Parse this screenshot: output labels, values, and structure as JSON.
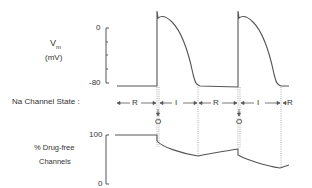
{
  "vm_panel": {
    "label_line1": "Vm",
    "label_var": "V",
    "label_sub": "m",
    "unit": "(mV)",
    "tick_top": "0",
    "tick_bottom": "-80"
  },
  "state_panel": {
    "label": "Na Channel State :",
    "states": [
      "R",
      "I",
      "R",
      "I",
      "R"
    ],
    "open_markers": [
      "O",
      "O"
    ]
  },
  "drug_panel": {
    "label_line1": "% Drug-free",
    "label_line2": "Channels",
    "tick_top": "100",
    "tick_bottom": "0"
  },
  "colors": {
    "line": "#555555",
    "dotted": "#999999",
    "text": "#333333"
  }
}
